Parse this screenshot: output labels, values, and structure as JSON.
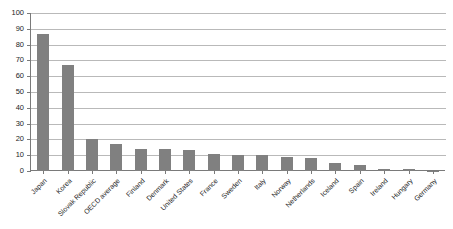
{
  "chart_data": {
    "type": "bar",
    "title": "",
    "subtitle": "",
    "xlabel": "",
    "ylabel": "",
    "ylim": [
      0,
      100
    ],
    "ytick_step": 10,
    "yticks": [
      100,
      90,
      80,
      70,
      60,
      50,
      40,
      30,
      20,
      10,
      0
    ],
    "grid": "horizontal",
    "legend": "none",
    "bar_color": "#808080",
    "axis_color": "#7a7a7a",
    "gridline_color": "#b9b9b9",
    "categories": [
      "Japan",
      "Korea",
      "Slovak Republic",
      "OECD average",
      "Finland",
      "Denmark",
      "United States",
      "France",
      "Sweden",
      "Italy",
      "Norway",
      "Netherlands",
      "Iceland",
      "Spain",
      "Ireland",
      "Hungary",
      "Germany"
    ],
    "values": [
      87,
      67,
      20,
      17,
      14,
      14,
      13,
      11,
      10,
      10,
      9,
      8.5,
      5,
      4,
      1.5,
      1.5,
      0.3
    ],
    "series": [
      {
        "name": "",
        "values": [
          87,
          67,
          20,
          17,
          14,
          14,
          13,
          11,
          10,
          10,
          9,
          8.5,
          5,
          4,
          1.5,
          1.5,
          0.3
        ]
      }
    ]
  }
}
